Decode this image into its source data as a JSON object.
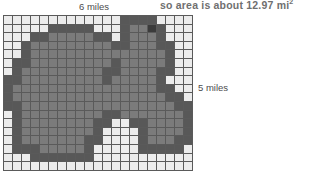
{
  "caption": {
    "text": "so area is about 12.97 mi",
    "superscript": "2",
    "full": "so area is about 12.97 mi²",
    "value": 12.97,
    "unit": "mi²",
    "color": "#6f6f6f"
  },
  "labels": {
    "top": "6 miles",
    "right": "5 miles"
  },
  "measurements": {
    "width_miles": 6,
    "height_miles": 5,
    "area_miles_sq": 12.97
  },
  "grid": {
    "columns": 21,
    "rows": 18,
    "line_color": "#5a5a5a",
    "shade_colors": {
      "0": "#ececec",
      "1": "#9a9a9a",
      "2": "#7b7b7b",
      "3": "#585858",
      "4": "#3b3b3b"
    },
    "cells": [
      [
        0,
        0,
        0,
        0,
        0,
        0,
        0,
        0,
        0,
        0,
        0,
        0,
        0,
        3,
        3,
        3,
        3,
        0,
        0,
        0,
        0
      ],
      [
        0,
        0,
        0,
        0,
        0,
        3,
        3,
        3,
        3,
        3,
        0,
        0,
        0,
        3,
        2,
        2,
        4,
        3,
        0,
        0,
        0
      ],
      [
        0,
        0,
        0,
        3,
        3,
        2,
        2,
        2,
        2,
        2,
        3,
        3,
        0,
        3,
        2,
        2,
        2,
        3,
        0,
        0,
        0
      ],
      [
        0,
        0,
        3,
        2,
        2,
        2,
        2,
        2,
        2,
        2,
        2,
        2,
        3,
        3,
        2,
        2,
        2,
        3,
        3,
        0,
        0
      ],
      [
        0,
        0,
        3,
        2,
        2,
        2,
        2,
        2,
        2,
        2,
        2,
        2,
        2,
        2,
        2,
        2,
        2,
        2,
        3,
        0,
        0
      ],
      [
        0,
        3,
        3,
        2,
        2,
        2,
        2,
        2,
        2,
        2,
        2,
        2,
        3,
        2,
        2,
        2,
        2,
        2,
        3,
        0,
        0
      ],
      [
        0,
        3,
        2,
        2,
        2,
        2,
        2,
        2,
        2,
        2,
        2,
        3,
        3,
        2,
        2,
        2,
        2,
        3,
        3,
        0,
        0
      ],
      [
        3,
        3,
        2,
        2,
        2,
        2,
        2,
        2,
        2,
        2,
        2,
        3,
        2,
        2,
        2,
        2,
        2,
        3,
        0,
        0,
        0
      ],
      [
        3,
        2,
        2,
        2,
        2,
        2,
        2,
        2,
        2,
        2,
        2,
        2,
        2,
        2,
        2,
        2,
        2,
        3,
        3,
        0,
        0
      ],
      [
        3,
        2,
        2,
        2,
        2,
        2,
        2,
        2,
        2,
        2,
        2,
        2,
        2,
        2,
        2,
        2,
        2,
        2,
        3,
        3,
        0
      ],
      [
        3,
        3,
        2,
        2,
        2,
        2,
        2,
        2,
        2,
        2,
        2,
        2,
        2,
        2,
        2,
        2,
        2,
        2,
        2,
        3,
        3
      ],
      [
        0,
        3,
        2,
        2,
        2,
        2,
        2,
        2,
        2,
        2,
        2,
        3,
        3,
        2,
        2,
        2,
        2,
        2,
        2,
        2,
        3
      ],
      [
        0,
        3,
        2,
        2,
        2,
        2,
        2,
        2,
        2,
        2,
        3,
        3,
        0,
        0,
        3,
        3,
        2,
        2,
        2,
        2,
        3
      ],
      [
        0,
        3,
        2,
        2,
        2,
        2,
        2,
        2,
        2,
        2,
        3,
        0,
        0,
        0,
        0,
        3,
        2,
        2,
        2,
        2,
        3
      ],
      [
        0,
        3,
        2,
        2,
        2,
        2,
        2,
        2,
        2,
        3,
        3,
        0,
        0,
        0,
        0,
        3,
        2,
        2,
        2,
        3,
        3
      ],
      [
        0,
        3,
        3,
        3,
        2,
        2,
        2,
        2,
        2,
        3,
        0,
        0,
        0,
        0,
        0,
        3,
        3,
        3,
        3,
        3,
        0
      ],
      [
        0,
        0,
        0,
        3,
        3,
        3,
        3,
        3,
        3,
        3,
        0,
        0,
        0,
        0,
        0,
        0,
        0,
        0,
        0,
        0,
        0
      ],
      [
        0,
        0,
        0,
        0,
        0,
        0,
        0,
        0,
        0,
        0,
        0,
        0,
        0,
        0,
        0,
        0,
        0,
        0,
        0,
        0,
        0
      ]
    ]
  }
}
